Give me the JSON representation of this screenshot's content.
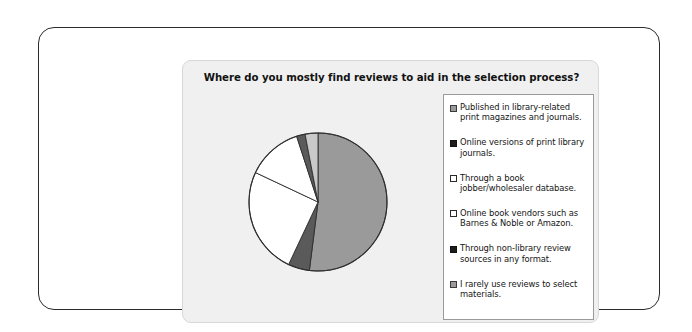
{
  "chart_panel": {
    "title": "Where do you mostly find reviews to aid in the selection process?"
  },
  "legend": {
    "items": [
      {
        "label": "Published in library-related print magazines and journals.",
        "swatch": "gray"
      },
      {
        "label": "Online versions of print library journals.",
        "swatch": "black"
      },
      {
        "label": "Through a book jobber/wholesaler database.",
        "swatch": "white"
      },
      {
        "label": "Online book vendors such as Barnes & Noble or Amazon.",
        "swatch": "white"
      },
      {
        "label": "Through non-library review sources in any format.",
        "swatch": "black"
      },
      {
        "label": "I rarely use reviews to select materials.",
        "swatch": "gray"
      }
    ]
  },
  "chart_data": {
    "type": "pie",
    "title": "Where do you mostly find reviews to aid in the selection process?",
    "legend_position": "right",
    "grid": false,
    "start_angle_deg": 0,
    "direction": "clockwise",
    "categories": [
      "Published in library-related print magazines and journals.",
      "Online versions of print library journals.",
      "Through a book jobber/wholesaler database.",
      "Online book vendors such as Barnes & Noble or Amazon.",
      "Through non-library review sources in any format.",
      "I rarely use reviews to select materials."
    ],
    "values": [
      52,
      5,
      25,
      13,
      2,
      3
    ],
    "colors": [
      "#9a9a9a",
      "#5a5a5a",
      "#ffffff",
      "#ffffff",
      "#5a5a5a",
      "#c9c9c9"
    ],
    "units": "percent"
  }
}
